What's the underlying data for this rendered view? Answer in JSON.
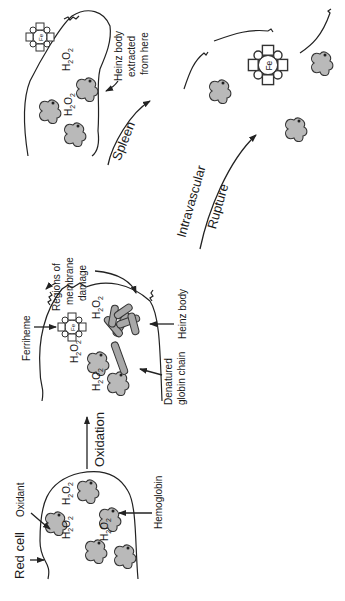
{
  "diagram": {
    "orientation": "rotated-90-ccw",
    "stages": [
      {
        "id": "red-cell",
        "labels": {
          "cell": "Red cell",
          "oxidant": "Oxidant",
          "hemoglobin": "Hemoglobin"
        },
        "molecules": [
          "H2O2",
          "H2O2",
          "H2O2"
        ]
      },
      {
        "id": "oxidized-cell",
        "labels": {
          "ferriheme": "Ferriheme",
          "membrane_damage_1": "Regions of",
          "membrane_damage_2": "membrane",
          "membrane_damage_3": "damage",
          "heinz_body": "Heinz body",
          "denatured_1": "Denatured",
          "denatured_2": "globin chain"
        },
        "molecules": [
          "H2O2",
          "H2O2",
          "H2O2"
        ]
      },
      {
        "id": "spleen-cell",
        "labels": {
          "extracted_1": "Heinz body",
          "extracted_2": "extracted",
          "extracted_3": "from here"
        },
        "molecules": [
          "H2O2",
          "H2O2"
        ]
      },
      {
        "id": "ruptured-cell",
        "labels": {}
      }
    ],
    "transitions": {
      "oxidation": "Oxidation",
      "spleen": "Spleen",
      "intravascular_1": "Intravascular",
      "intravascular_2": "Rupture"
    },
    "symbols": {
      "iron": "Fe",
      "h2o2_main": "H",
      "h2o2_sub1": "2",
      "h2o2_mid": "O",
      "h2o2_sub2": "2"
    }
  }
}
